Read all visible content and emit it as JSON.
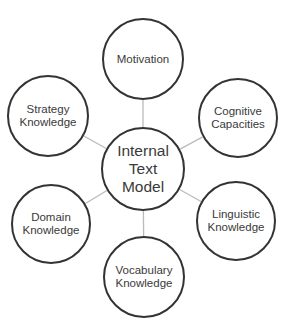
{
  "diagram": {
    "type": "hub-and-spoke",
    "colors": {
      "circle_stroke": "#333333",
      "connector": "#bbbbbb",
      "text": "#3a3a3a",
      "background": "#ffffff"
    },
    "center": {
      "id": "internal-text-model",
      "label": "Internal\nText\nModel",
      "cx": 143,
      "cy": 169,
      "r": 42
    },
    "nodes": [
      {
        "id": "motivation",
        "label": "Motivation",
        "cx": 143,
        "cy": 59,
        "r": 41
      },
      {
        "id": "cognitive-capacities",
        "label": "Cognitive\nCapacities",
        "cx": 238,
        "cy": 118,
        "r": 40
      },
      {
        "id": "linguistic-knowledge",
        "label": "Linguistic\nKnowledge",
        "cx": 236,
        "cy": 221,
        "r": 40
      },
      {
        "id": "vocabulary-knowledge",
        "label": "Vocabulary\nKnowledge",
        "cx": 144,
        "cy": 277,
        "r": 41
      },
      {
        "id": "domain-knowledge",
        "label": "Domain\nKnowledge",
        "cx": 51,
        "cy": 224,
        "r": 40
      },
      {
        "id": "strategy-knowledge",
        "label": "Strategy\nKnowledge",
        "cx": 48,
        "cy": 116,
        "r": 41
      }
    ]
  }
}
